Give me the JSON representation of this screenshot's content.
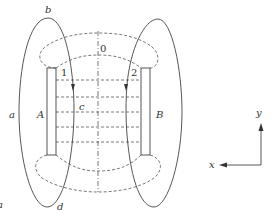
{
  "diagram": {
    "labels": {
      "a": "a",
      "b": "b",
      "c": "c",
      "d": "d",
      "A": "A",
      "B": "B",
      "zero": "0",
      "one": "1",
      "two": "2",
      "x": "x",
      "y": "y",
      "corner": "a"
    },
    "colors": {
      "line": "#444444",
      "dashed": "#555555",
      "background": "#ffffff"
    }
  }
}
